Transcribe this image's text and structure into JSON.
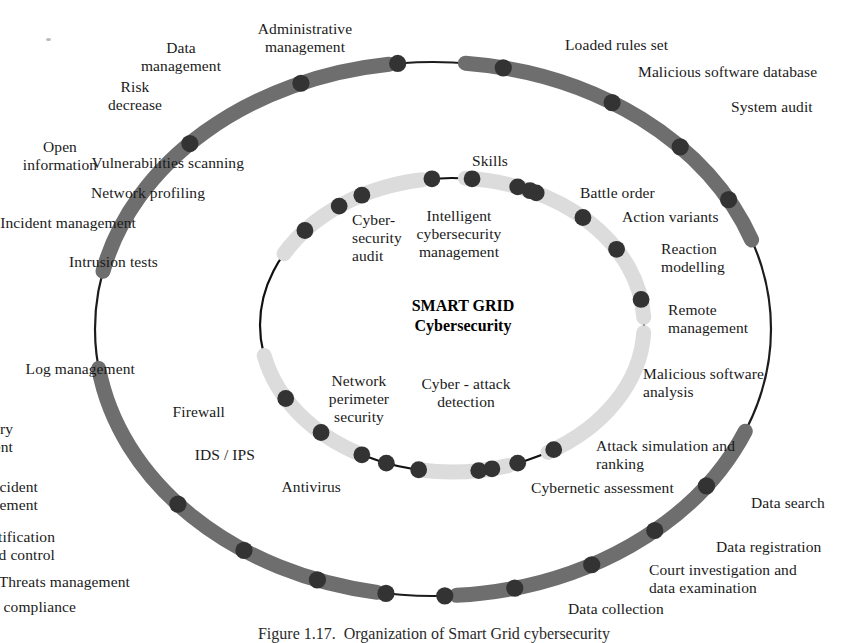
{
  "figure": {
    "center_title": "SMART GRID\nCybersecurity",
    "caption": "Figure 1.17.  Organization of Smart Grid cybersecurity"
  },
  "colors": {
    "outer_ring_band": "#6e6e6e",
    "outer_ring_thin": "#1c1c1c",
    "inner_ring_band": "#dcdcdc",
    "inner_ring_thin": "#111111",
    "node_dot": "#333333",
    "node_dot_inner_dark": "#262626",
    "background": "#ffffff",
    "text": "#1a1a1a"
  },
  "outer_ring": {
    "name": "outer-process-ring",
    "gap_top": true,
    "gap_left": true,
    "nodes": [
      {
        "label": "Administrative\nmanagement",
        "angle_deg": -78,
        "align": "c",
        "lx": 305,
        "ly": 20
      },
      {
        "label": "Data\nmanagement",
        "angle_deg": -96,
        "align": "c",
        "lx": 181,
        "ly": 39
      },
      {
        "label": "Risk\ndecrease",
        "angle_deg": -113,
        "align": "c",
        "lx": 135,
        "ly": 78
      },
      {
        "label": "Open\ninformation",
        "angle_deg": -136,
        "align": "c",
        "lx": 60,
        "ly": 138
      },
      {
        "label": "Loaded rules set",
        "angle_deg": -58,
        "align": "l",
        "lx": 565,
        "ly": 36
      },
      {
        "label": "Malicious software database",
        "angle_deg": -43,
        "align": "l",
        "lx": 638,
        "ly": 63
      },
      {
        "label": "System audit",
        "angle_deg": -29,
        "align": "l",
        "lx": 731,
        "ly": 98
      },
      {
        "label": "Delivery\nmanagement",
        "angle_deg": 139,
        "align": "r",
        "lx": 13,
        "ly": 420
      },
      {
        "label": "Incident\nmanagement",
        "angle_deg": 124,
        "align": "r",
        "lx": 38,
        "ly": 478
      },
      {
        "label": "Access identification\nand control",
        "angle_deg": 110,
        "align": "r",
        "lx": 55,
        "ly": 528
      },
      {
        "label": "Threats management",
        "angle_deg": 98,
        "align": "r",
        "lx": 130,
        "ly": 573
      },
      {
        "label": "Policies management and compliance",
        "angle_deg": 88,
        "align": "r",
        "lx": 76,
        "ly": 598
      },
      {
        "label": "Data search",
        "angle_deg": 36,
        "align": "l",
        "lx": 751,
        "ly": 494
      },
      {
        "label": "Data registration",
        "angle_deg": 49,
        "align": "l",
        "lx": 716,
        "ly": 538
      },
      {
        "label": "Court investigation and\ndata examination",
        "angle_deg": 62,
        "align": "l",
        "lx": 649,
        "ly": 561
      },
      {
        "label": "Data collection",
        "angle_deg": 76,
        "align": "l",
        "lx": 568,
        "ly": 600
      }
    ]
  },
  "inner_ring": {
    "name": "inner-process-ring",
    "gap_top": true,
    "gap_left": true,
    "gap_bottom": true,
    "nodes": [
      {
        "label": "Vulnerabilities scanning",
        "angle_deg": -70,
        "align": "r",
        "lx": 244,
        "ly": 154
      },
      {
        "label": "Network profiling",
        "angle_deg": -96,
        "align": "r",
        "lx": 205,
        "ly": 184
      },
      {
        "label": "Cyber-\nsecurity\naudit",
        "angle_deg": -118,
        "align": "l",
        "lx": 352,
        "ly": 211
      },
      {
        "label": "Incident management",
        "angle_deg": -126,
        "align": "r",
        "lx": 136,
        "ly": 214
      },
      {
        "label": "Intrusion tests",
        "angle_deg": -140,
        "align": "r",
        "lx": 158,
        "ly": 253
      },
      {
        "label": "Skills",
        "angle_deg": -84,
        "align": "c",
        "lx": 490,
        "ly": 152
      },
      {
        "label": "Intelligent\ncybersecurity\nmanagement",
        "angle_deg": -66,
        "align": "c",
        "lx": 459,
        "ly": 207
      },
      {
        "label": "Battle order",
        "angle_deg": -64,
        "align": "l",
        "lx": 580,
        "ly": 184
      },
      {
        "label": "Action variants",
        "angle_deg": -47,
        "align": "l",
        "lx": 622,
        "ly": 208
      },
      {
        "label": "Reaction\nmodelling",
        "angle_deg": -31,
        "align": "l",
        "lx": 661,
        "ly": 240
      },
      {
        "label": "Remote\nmanagement",
        "angle_deg": -10,
        "align": "l",
        "lx": 668,
        "ly": 301
      },
      {
        "label": "Log management",
        "angle_deg": 150,
        "align": "r",
        "lx": 135,
        "ly": 360
      },
      {
        "label": "Firewall",
        "angle_deg": 133,
        "align": "r",
        "lx": 225,
        "ly": 403
      },
      {
        "label": "IDS / IPS",
        "angle_deg": 118,
        "align": "r",
        "lx": 255,
        "ly": 446
      },
      {
        "label": "Antivirus",
        "angle_deg": 100,
        "align": "r",
        "lx": 341,
        "ly": 478
      },
      {
        "label": "Network\nperimeter\nsecurity",
        "angle_deg": 110,
        "align": "c",
        "lx": 359,
        "ly": 372
      },
      {
        "label": "Cyber - attack\ndetection",
        "angle_deg": 78,
        "align": "c",
        "lx": 466,
        "ly": 375
      },
      {
        "label": "Malicious software\nanalysis",
        "angle_deg": 58,
        "align": "l",
        "lx": 643,
        "ly": 365
      },
      {
        "label": "Attack simulation and\nranking",
        "angle_deg": 70,
        "align": "l",
        "lx": 596,
        "ly": 437
      },
      {
        "label": "Cybernetic assessment",
        "angle_deg": 82,
        "align": "l",
        "lx": 531,
        "ly": 479
      }
    ]
  }
}
